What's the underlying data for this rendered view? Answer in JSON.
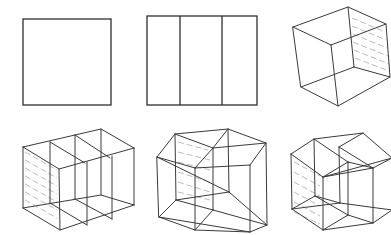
{
  "diagram": {
    "title": "",
    "colors": {
      "line": "#3a3a3a",
      "hatch": "#a8a8a8",
      "background": "#ffffff"
    },
    "figures": [
      {
        "id": "square",
        "label": "",
        "row": 1,
        "col": 1
      },
      {
        "id": "square-three-strips",
        "label": "",
        "row": 1,
        "col": 2
      },
      {
        "id": "cube",
        "label": "",
        "row": 1,
        "col": 3
      },
      {
        "id": "cube-three-slices",
        "label": "",
        "row": 2,
        "col": 1
      },
      {
        "id": "hypercube-projection",
        "label": "",
        "row": 2,
        "col": 2
      },
      {
        "id": "hypercube-projection-variant",
        "label": "",
        "row": 2,
        "col": 3
      }
    ]
  }
}
